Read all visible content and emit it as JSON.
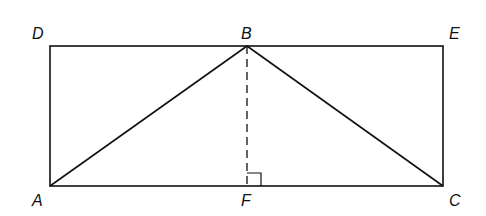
{
  "diagram": {
    "type": "geometry",
    "points": {
      "A": {
        "label": "A",
        "x": 50,
        "y": 186
      },
      "C": {
        "label": "C",
        "x": 443,
        "y": 186
      },
      "D": {
        "label": "D",
        "x": 50,
        "y": 46
      },
      "E": {
        "label": "E",
        "x": 443,
        "y": 46
      },
      "B": {
        "label": "B",
        "x": 247,
        "y": 46
      },
      "F": {
        "label": "F",
        "x": 247,
        "y": 186
      }
    },
    "segments": [
      {
        "from": "D",
        "to": "E",
        "style": "solid"
      },
      {
        "from": "D",
        "to": "A",
        "style": "solid"
      },
      {
        "from": "E",
        "to": "C",
        "style": "solid"
      },
      {
        "from": "A",
        "to": "C",
        "style": "solid"
      },
      {
        "from": "A",
        "to": "B",
        "style": "solid"
      },
      {
        "from": "B",
        "to": "C",
        "style": "solid"
      },
      {
        "from": "B",
        "to": "F",
        "style": "dashed"
      }
    ],
    "right_angle_marker": {
      "at": "F"
    },
    "stroke_color": "#111111"
  }
}
